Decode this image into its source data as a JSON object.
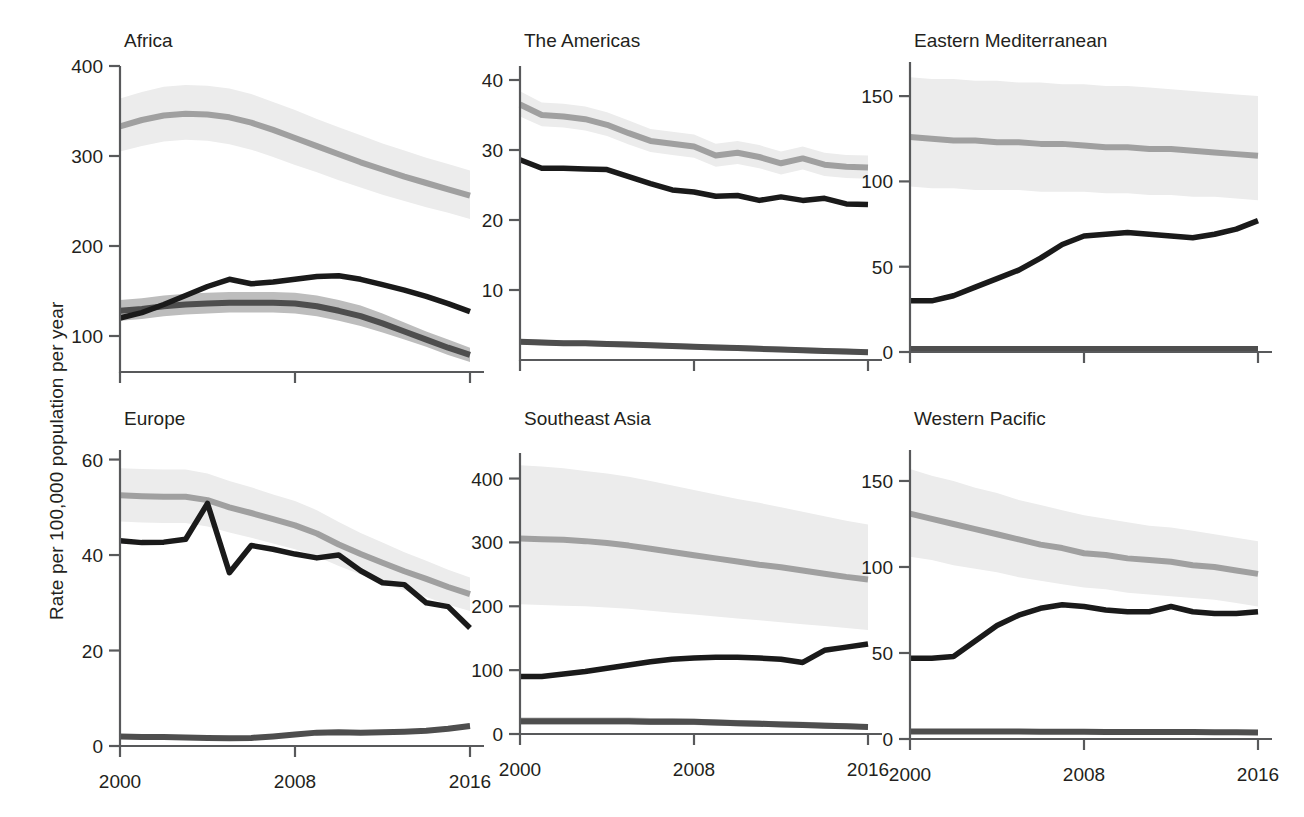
{
  "figure": {
    "ylabel": "Rate per 100,000 population per year",
    "xlabel": "",
    "x_ticks": [
      "2000",
      "2008",
      "2016"
    ],
    "colors": {
      "series_light_line": "#a0a0a0",
      "series_light_band": "#ececec",
      "series_mid_line": "#4e4e4e",
      "series_mid_band": "#bdbdbd",
      "series_dark_line": "#1a1a1a",
      "axis": "#58595b",
      "text": "#231f20",
      "background": "#ffffff"
    }
  },
  "chart_data": {
    "type": "line",
    "title": "",
    "xlabel": "",
    "ylabel": "Rate per 100,000 population per year",
    "grid": false,
    "legend": "none",
    "x": [
      2000,
      2001,
      2002,
      2003,
      2004,
      2005,
      2006,
      2007,
      2008,
      2009,
      2010,
      2011,
      2012,
      2013,
      2014,
      2015,
      2016
    ],
    "x_ticks": [
      2000,
      2008,
      2016
    ],
    "xlim": [
      2000,
      2016
    ],
    "panels": [
      {
        "name": "Africa",
        "ylim": [
          60,
          400
        ],
        "y_ticks": [
          100,
          200,
          300,
          400
        ],
        "series": [
          {
            "name": "series-light",
            "style": "light",
            "values": [
              333,
              340,
              345,
              347,
              346,
              343,
              337,
              329,
              320,
              311,
              302,
              293,
              285,
              277,
              270,
              263,
              256
            ],
            "band_low": [
              305,
              311,
              316,
              318,
              317,
              313,
              307,
              299,
              290,
              282,
              273,
              265,
              257,
              250,
              243,
              237,
              230
            ],
            "band_high": [
              364,
              371,
              377,
              379,
              378,
              375,
              369,
              360,
              351,
              341,
              332,
              323,
              314,
              306,
              298,
              291,
              284
            ]
          },
          {
            "name": "series-mid",
            "style": "mid",
            "values": [
              128,
              130,
              133,
              135,
              136,
              137,
              137,
              137,
              136,
              133,
              128,
              122,
              114,
              105,
              96,
              87,
              79
            ],
            "band_low": [
              117,
              119,
              122,
              124,
              125,
              126,
              126,
              126,
              125,
              122,
              117,
              111,
              104,
              96,
              88,
              79,
              71
            ],
            "band_high": [
              140,
              142,
              145,
              147,
              148,
              149,
              149,
              149,
              148,
              145,
              140,
              134,
              125,
              115,
              105,
              96,
              87
            ]
          },
          {
            "name": "series-dark",
            "style": "dark",
            "values": [
              120,
              126,
              135,
              145,
              155,
              163,
              158,
              160,
              163,
              166,
              167,
              163,
              157,
              151,
              144,
              136,
              127
            ],
            "band_low": null,
            "band_high": null
          }
        ]
      },
      {
        "name": "The Americas",
        "ylim": [
          0,
          42
        ],
        "y_ticks": [
          10,
          20,
          30,
          40
        ],
        "series": [
          {
            "name": "series-light",
            "style": "light",
            "values": [
              36.5,
              35.0,
              34.8,
              34.4,
              33.6,
              32.4,
              31.3,
              30.9,
              30.5,
              29.2,
              29.6,
              29.0,
              28.1,
              28.8,
              27.9,
              27.6,
              27.5
            ],
            "band_low": [
              34.8,
              33.4,
              33.2,
              32.8,
              32.0,
              30.8,
              29.7,
              29.3,
              28.9,
              27.6,
              28.0,
              27.4,
              26.5,
              27.2,
              26.3,
              26.0,
              25.9
            ],
            "band_high": [
              38.4,
              36.8,
              36.6,
              36.2,
              35.4,
              34.2,
              33.0,
              32.6,
              32.2,
              30.9,
              31.3,
              30.7,
              29.8,
              30.5,
              29.6,
              29.3,
              29.2
            ]
          },
          {
            "name": "series-dark",
            "style": "dark",
            "values": [
              28.6,
              27.4,
              27.4,
              27.3,
              27.2,
              26.2,
              25.2,
              24.3,
              24.0,
              23.4,
              23.5,
              22.8,
              23.3,
              22.8,
              23.1,
              22.3,
              22.2
            ],
            "band_low": null,
            "band_high": null
          },
          {
            "name": "series-mid",
            "style": "mid",
            "values": [
              2.6,
              2.5,
              2.4,
              2.4,
              2.3,
              2.2,
              2.1,
              2.0,
              1.9,
              1.8,
              1.7,
              1.6,
              1.5,
              1.4,
              1.3,
              1.2,
              1.1
            ],
            "band_low": [
              2.2,
              2.1,
              2.0,
              2.0,
              1.9,
              1.8,
              1.7,
              1.6,
              1.5,
              1.4,
              1.3,
              1.2,
              1.1,
              1.0,
              0.9,
              0.8,
              0.7
            ],
            "band_high": [
              3.0,
              2.9,
              2.8,
              2.8,
              2.7,
              2.6,
              2.5,
              2.4,
              2.3,
              2.2,
              2.1,
              2.0,
              1.9,
              1.8,
              1.7,
              1.6,
              1.5
            ]
          }
        ]
      },
      {
        "name": "Eastern Mediterranean",
        "ylim": [
          0,
          170
        ],
        "y_ticks": [
          0,
          50,
          100,
          150
        ],
        "series": [
          {
            "name": "series-light",
            "style": "light",
            "values": [
              126,
              125,
              124,
              124,
              123,
              123,
              122,
              122,
              121,
              120,
              120,
              119,
              119,
              118,
              117,
              116,
              115
            ],
            "band_low": [
              97,
              96,
              96,
              95,
              95,
              95,
              94,
              94,
              94,
              93,
              93,
              92,
              92,
              91,
              91,
              90,
              89
            ],
            "band_high": [
              161,
              160,
              160,
              159,
              159,
              158,
              158,
              157,
              157,
              156,
              156,
              155,
              154,
              153,
              152,
              151,
              150
            ]
          },
          {
            "name": "series-dark",
            "style": "dark",
            "values": [
              30,
              30,
              33,
              38,
              43,
              48,
              55,
              63,
              68,
              69,
              70,
              69,
              68,
              67,
              69,
              72,
              77
            ],
            "band_low": null,
            "band_high": null
          },
          {
            "name": "series-mid",
            "style": "mid",
            "values": [
              1.8,
              1.8,
              1.8,
              1.8,
              1.8,
              1.8,
              1.8,
              1.8,
              1.8,
              1.8,
              1.8,
              1.8,
              1.8,
              1.8,
              1.8,
              1.8,
              1.8
            ],
            "band_low": [
              1.0,
              1.0,
              1.0,
              1.0,
              1.0,
              1.0,
              1.0,
              1.0,
              1.0,
              1.0,
              1.0,
              1.0,
              1.0,
              1.0,
              1.0,
              1.0,
              1.0
            ],
            "band_high": [
              2.6,
              2.6,
              2.6,
              2.6,
              2.6,
              2.6,
              2.6,
              2.6,
              2.6,
              2.6,
              2.6,
              2.6,
              2.6,
              2.6,
              2.6,
              2.6,
              2.6
            ]
          }
        ]
      },
      {
        "name": "Europe",
        "ylim": [
          0,
          62
        ],
        "y_ticks": [
          0,
          20,
          40,
          60
        ],
        "series": [
          {
            "name": "series-light",
            "style": "light",
            "values": [
              52.5,
              52.3,
              52.2,
              52.2,
              51.5,
              50.0,
              48.8,
              47.5,
              46.2,
              44.5,
              42.2,
              40.2,
              38.4,
              36.6,
              35.0,
              33.3,
              31.8
            ],
            "band_low": [
              47.0,
              46.8,
              46.7,
              46.7,
              46.0,
              44.7,
              43.6,
              42.4,
              41.2,
              39.7,
              37.7,
              35.9,
              34.3,
              32.6,
              31.2,
              29.6,
              28.3
            ],
            "band_high": [
              58.2,
              58.0,
              57.9,
              57.9,
              57.1,
              55.5,
              54.2,
              52.7,
              51.3,
              49.4,
              46.9,
              44.6,
              42.6,
              40.6,
              38.8,
              36.9,
              35.3
            ]
          },
          {
            "name": "series-dark",
            "style": "dark",
            "values": [
              43.0,
              42.6,
              42.7,
              43.3,
              50.8,
              36.3,
              42.0,
              41.2,
              40.2,
              39.4,
              40.0,
              36.7,
              34.2,
              33.8,
              30.0,
              29.2,
              24.7
            ],
            "band_low": null,
            "band_high": null
          },
          {
            "name": "series-mid",
            "style": "mid",
            "values": [
              2.0,
              1.9,
              1.9,
              1.8,
              1.7,
              1.6,
              1.7,
              2.0,
              2.4,
              2.8,
              2.9,
              2.8,
              2.9,
              3.0,
              3.2,
              3.6,
              4.2
            ],
            "band_low": [
              1.6,
              1.5,
              1.5,
              1.4,
              1.3,
              1.2,
              1.3,
              1.6,
              2.0,
              2.4,
              2.5,
              2.4,
              2.5,
              2.6,
              2.8,
              3.2,
              3.7
            ],
            "band_high": [
              2.4,
              2.3,
              2.3,
              2.2,
              2.1,
              2.0,
              2.1,
              2.4,
              2.8,
              3.2,
              3.3,
              3.2,
              3.3,
              3.4,
              3.6,
              4.0,
              4.7
            ]
          }
        ]
      },
      {
        "name": "Southeast Asia",
        "ylim": [
          0,
          440
        ],
        "y_ticks": [
          0,
          100,
          200,
          300,
          400
        ],
        "series": [
          {
            "name": "series-light",
            "style": "light",
            "values": [
              306,
              305,
              304,
              302,
              299,
              295,
              290,
              285,
              280,
              275,
              270,
              265,
              261,
              256,
              251,
              246,
              242
            ],
            "band_low": [
              203,
              202,
              201,
              200,
              198,
              196,
              193,
              190,
              187,
              184,
              181,
              178,
              175,
              172,
              169,
              166,
              163
            ],
            "band_high": [
              421,
              419,
              416,
              412,
              408,
              403,
              396,
              389,
              382,
              375,
              368,
              362,
              355,
              348,
              341,
              334,
              328
            ]
          },
          {
            "name": "series-dark",
            "style": "dark",
            "values": [
              90,
              90,
              94,
              98,
              103,
              108,
              113,
              117,
              119,
              120,
              120,
              119,
              117,
              112,
              131,
              136,
              141
            ],
            "band_low": null,
            "band_high": null
          },
          {
            "name": "series-mid",
            "style": "mid",
            "values": [
              20,
              20,
              20,
              20,
              20,
              20,
              19,
              19,
              19,
              18,
              17,
              16,
              15,
              14,
              13,
              12,
              11
            ],
            "band_low": [
              15,
              15,
              15,
              15,
              15,
              15,
              14,
              14,
              14,
              13,
              12,
              11,
              11,
              10,
              9,
              8,
              8
            ],
            "band_high": [
              26,
              26,
              26,
              26,
              26,
              26,
              25,
              25,
              24,
              23,
              22,
              21,
              20,
              19,
              18,
              17,
              15
            ]
          }
        ]
      },
      {
        "name": "Western Pacific",
        "ylim": [
          0,
          168
        ],
        "y_ticks": [
          0,
          50,
          100,
          150
        ],
        "series": [
          {
            "name": "series-light",
            "style": "light",
            "values": [
              131,
              128,
              125,
              122,
              119,
              116,
              113,
              111,
              108,
              107,
              105,
              104,
              103,
              101,
              100,
              98,
              96
            ],
            "band_low": [
              106,
              104,
              101,
              99,
              97,
              94,
              92,
              90,
              88,
              87,
              85,
              84,
              83,
              82,
              81,
              79,
              77
            ],
            "band_high": [
              157,
              153,
              150,
              146,
              143,
              139,
              136,
              133,
              130,
              128,
              126,
              124,
              123,
              121,
              119,
              117,
              115
            ]
          },
          {
            "name": "series-dark",
            "style": "dark",
            "values": [
              47,
              47,
              48,
              57,
              66,
              72,
              76,
              78,
              77,
              75,
              74,
              74,
              77,
              74,
              73,
              73,
              74
            ],
            "band_low": null,
            "band_high": null
          },
          {
            "name": "series-mid",
            "style": "mid",
            "values": [
              4.4,
              4.4,
              4.4,
              4.3,
              4.3,
              4.3,
              4.2,
              4.2,
              4.2,
              4.1,
              4.1,
              4.0,
              4.0,
              4.0,
              3.9,
              3.9,
              3.8
            ],
            "band_low": [
              3.6,
              3.6,
              3.6,
              3.5,
              3.5,
              3.5,
              3.4,
              3.4,
              3.4,
              3.3,
              3.3,
              3.2,
              3.2,
              3.2,
              3.1,
              3.1,
              3.0
            ],
            "band_high": [
              5.2,
              5.2,
              5.2,
              5.1,
              5.1,
              5.1,
              5.0,
              5.0,
              5.0,
              4.9,
              4.9,
              4.8,
              4.8,
              4.8,
              4.7,
              4.7,
              4.6
            ]
          }
        ]
      }
    ]
  }
}
